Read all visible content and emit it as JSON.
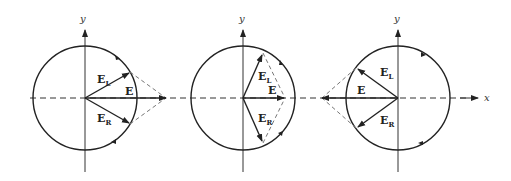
{
  "diagram": {
    "axis_labels": {
      "x": "x",
      "y": "y"
    },
    "vector_labels": {
      "E": "E",
      "EL_main": "E",
      "EL_sub": "L",
      "ER_main": "E",
      "ER_sub": "R"
    },
    "panels": [
      {
        "id": "panel-1",
        "center": [
          85,
          98
        ],
        "radius": 52,
        "E_direction": "right",
        "EL_angle_deg": 30,
        "ER_angle_deg": -30
      },
      {
        "id": "panel-2",
        "center": [
          243,
          98
        ],
        "radius": 52,
        "E_direction": "right",
        "EL_angle_deg": 65,
        "ER_angle_deg": -65
      },
      {
        "id": "panel-3",
        "center": [
          398,
          98
        ],
        "radius": 52,
        "E_direction": "left",
        "EL_angle_deg": 135,
        "ER_angle_deg": -135
      }
    ],
    "colors": {
      "line": "#222222",
      "dashed": "#777777"
    }
  }
}
